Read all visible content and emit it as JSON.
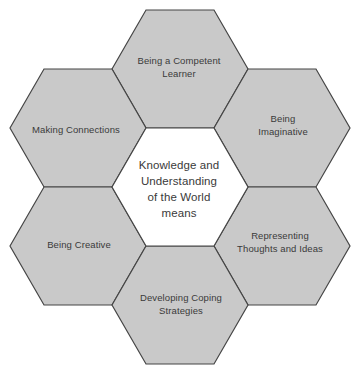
{
  "figure": {
    "nodes": {
      "top": {
        "label": "Being a Competent\nLearner"
      },
      "top_left": {
        "label": "Making Connections"
      },
      "top_right": {
        "label": "Being\nImaginative"
      },
      "center": {
        "label": "Knowledge and\nUnderstanding\nof the World\nmeans"
      },
      "bottom_left": {
        "label": "Being Creative"
      },
      "bottom_right": {
        "label": "Representing\nThoughts and Ideas"
      },
      "bottom": {
        "label": "Developing Coping\nStrategies"
      }
    },
    "colors": {
      "hex_fill": "#c9c9c9",
      "hex_stroke": "#454545",
      "center_fill": "#ffffff",
      "text_color": "#3a3a3a",
      "background": "#ffffff"
    }
  }
}
